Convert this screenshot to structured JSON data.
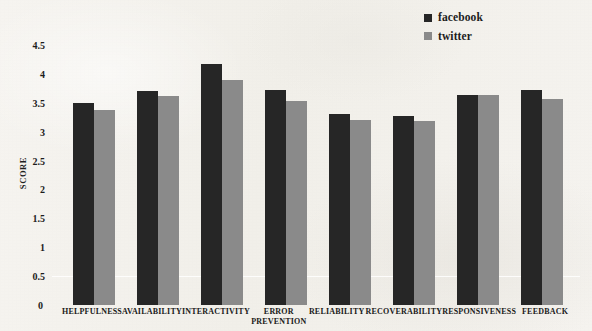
{
  "chart_data": {
    "type": "bar",
    "title": "",
    "xlabel": "",
    "ylabel": "SCORE",
    "ylim": [
      0,
      4.5
    ],
    "ytick_step": 0.5,
    "yticks": [
      "4.5",
      "4",
      "3.5",
      "3",
      "2.5",
      "2",
      "1.5",
      "1",
      "0.5",
      "0"
    ],
    "grid": false,
    "legend_position": "top-right",
    "categories": [
      "HELPFULNESS",
      "AVAILABILITY",
      "INTERACTIVITY",
      "ERROR PREVENTION",
      "RELIABILITY",
      "RECOVERABILITY",
      "RESPONSIVENESS",
      "FEEDBACK"
    ],
    "series": [
      {
        "name": "facebook",
        "color": "#262626",
        "values": [
          3.5,
          3.7,
          4.18,
          3.72,
          3.3,
          3.27,
          3.63,
          3.72
        ]
      },
      {
        "name": "twitter",
        "color": "#8a8a8a",
        "values": [
          3.37,
          3.62,
          3.9,
          3.53,
          3.2,
          3.18,
          3.64,
          3.57
        ]
      }
    ]
  },
  "legend": {
    "items": [
      {
        "label": "facebook",
        "color": "#262626"
      },
      {
        "label": "twitter",
        "color": "#8a8a8a"
      }
    ]
  },
  "axis": {
    "y_title": "SCORE",
    "zero_label": "0"
  },
  "category_lines": [
    [
      "HELPFULNESS"
    ],
    [
      "AVAILABILITY"
    ],
    [
      "INTERACTIVITY"
    ],
    [
      "ERROR",
      "PREVENTION"
    ],
    [
      "RELIABILITY"
    ],
    [
      "RECOVERABILITY"
    ],
    [
      "RESPONSIVENESS"
    ],
    [
      "FEEDBACK"
    ]
  ]
}
